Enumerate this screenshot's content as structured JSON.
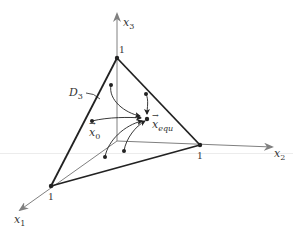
{
  "figure": {
    "axes": {
      "x1": {
        "label": "x",
        "sub": "1"
      },
      "x2": {
        "label": "x",
        "sub": "2"
      },
      "x3": {
        "label": "x",
        "sub": "3"
      }
    },
    "vertex_labels": {
      "top": "1",
      "right": "1",
      "left": "1"
    },
    "domain_label": {
      "label": "D",
      "sub": "3"
    },
    "initial_state": {
      "label": "x",
      "sub": "0"
    },
    "equilibrium": {
      "label": "x",
      "sub": "equ"
    },
    "colors": {
      "triangle": "#222222",
      "axis": "#808080",
      "trajectory": "#222222",
      "text": "#333333"
    }
  }
}
